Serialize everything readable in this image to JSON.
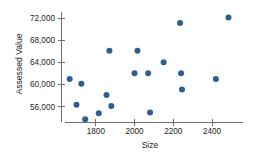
{
  "chart_data": {
    "type": "scatter",
    "title": "",
    "xlabel": "Size",
    "ylabel": "Assessed Value",
    "xlim": [
      1620,
      2560
    ],
    "ylim": [
      53200,
      73100
    ],
    "grid": false,
    "legend": null,
    "xticks": [
      1800,
      2000,
      2200,
      2400
    ],
    "xtick_labels": [
      "1800",
      "2000",
      "2200",
      "2400"
    ],
    "yticks": [
      56000,
      60000,
      64000,
      68000,
      72000
    ],
    "ytick_labels": [
      "56,000",
      "60,000",
      "64,000",
      "68,000",
      "72,000"
    ],
    "marker_color": "#2e5e8e",
    "marker_size": 3,
    "points": [
      {
        "x": 1665,
        "y": 61000
      },
      {
        "x": 1700,
        "y": 56300
      },
      {
        "x": 1725,
        "y": 60100
      },
      {
        "x": 1745,
        "y": 53700
      },
      {
        "x": 1815,
        "y": 54800
      },
      {
        "x": 1855,
        "y": 58100
      },
      {
        "x": 1870,
        "y": 66100
      },
      {
        "x": 1880,
        "y": 56100
      },
      {
        "x": 2000,
        "y": 62000
      },
      {
        "x": 2015,
        "y": 66100
      },
      {
        "x": 2070,
        "y": 62000
      },
      {
        "x": 2080,
        "y": 54900
      },
      {
        "x": 2150,
        "y": 64000
      },
      {
        "x": 2235,
        "y": 71100
      },
      {
        "x": 2240,
        "y": 62000
      },
      {
        "x": 2245,
        "y": 59100
      },
      {
        "x": 2420,
        "y": 61000
      },
      {
        "x": 2485,
        "y": 72100
      }
    ]
  }
}
